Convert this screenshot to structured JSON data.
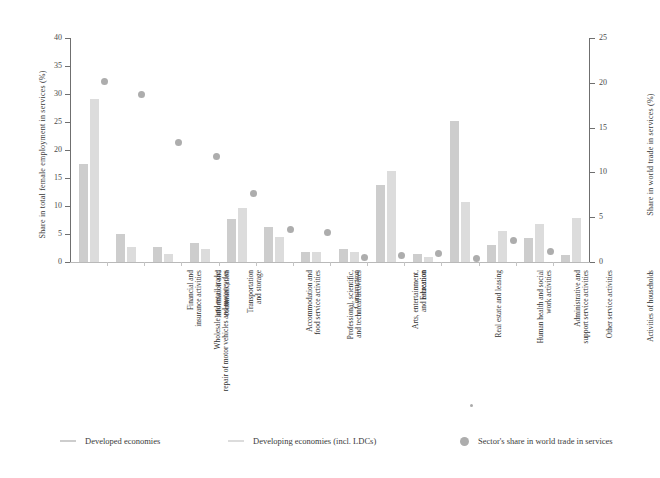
{
  "chart_data": {
    "type": "bar",
    "title": "",
    "subtitle": "",
    "xlabel": "",
    "ylabel": "Share in total female employment in services (%)",
    "y2label": "Share in world trade in services (%)",
    "ylim": [
      0,
      40
    ],
    "y2lim": [
      0,
      25
    ],
    "yticks": [
      "0",
      "5",
      "10",
      "15",
      "20",
      "25",
      "30",
      "35",
      "40"
    ],
    "y2ticks": [
      "0",
      "5",
      "10",
      "15",
      "20",
      "25"
    ],
    "grid": false,
    "legend_position": "bottom",
    "categories": [
      "Wholesale and retail trade;\nrepair of motor vehicles and motorcycles",
      "Financial and\ninsurance activities",
      "Information and\ncommunication",
      "Transportation\nand storage",
      "Accommodation and\nfood service activities",
      "Professional, scientific,\nand technical activities",
      "Construction",
      "Arts, entertainment,\nand recreation",
      "Education",
      "Real estate and leasing",
      "Human health and social\nwork activities",
      "Administrative and\nsupport service activities",
      "Other service activities",
      "Activities of households"
    ],
    "series": [
      {
        "name": "Developed economies",
        "color": "#cdcdcd",
        "axis": "left",
        "values": [
          17.5,
          5.0,
          2.6,
          3.4,
          7.7,
          6.3,
          1.8,
          2.3,
          13.8,
          1.4,
          25.2,
          3.0,
          4.2,
          1.3
        ]
      },
      {
        "name": "Developing economies (incl. LDCs)",
        "color": "#dcdcdc",
        "axis": "left",
        "values": [
          29.1,
          2.7,
          1.4,
          2.4,
          9.6,
          4.4,
          1.8,
          1.7,
          16.3,
          0.9,
          10.7,
          5.6,
          6.7,
          7.9
        ]
      },
      {
        "name": "Sector's share in world trade in services",
        "color": "#adadad",
        "axis": "right",
        "marker": "circle",
        "values": [
          20.1,
          18.7,
          13.3,
          11.8,
          7.7,
          3.6,
          3.3,
          0.5,
          0.7,
          1.0,
          0.4,
          2.4,
          1.2,
          0.0
        ]
      }
    ]
  },
  "legend": {
    "items": [
      {
        "label": "Developed economies",
        "marker": "line",
        "color": "#cdcdcd"
      },
      {
        "label": "Developing economies (incl. LDCs)",
        "marker": "line",
        "color": "#dcdcdc"
      },
      {
        "label": "Sector's share in world trade in services",
        "marker": "dot",
        "color": "#adadad"
      }
    ]
  },
  "axes": {
    "left_title": "Share in total female employment in services (%)",
    "right_title": "Share in world trade in services (%)"
  }
}
